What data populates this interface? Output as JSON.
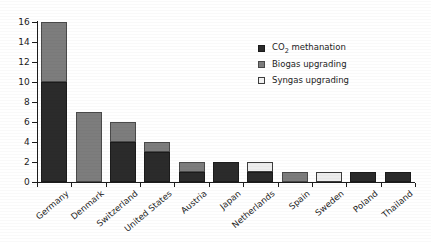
{
  "chart_data": {
    "type": "bar",
    "subtype": "stacked-vertical",
    "title": "",
    "subtitle": "",
    "xlabel": "",
    "ylabel": "",
    "ylim": [
      0,
      16
    ],
    "ytick_step": 2,
    "yticks": [
      "16",
      "14",
      "12",
      "10",
      "8",
      "6",
      "4",
      "2",
      "0"
    ],
    "grid": false,
    "legend_position": "top-right-inside",
    "categories": [
      "Germany",
      "Denmark",
      "Switzerland",
      "United States",
      "Austria",
      "Japan",
      "Netherlands",
      "Spain",
      "Sweden",
      "Poland",
      "Thailand"
    ],
    "series": [
      {
        "name": "CO2 methanation",
        "label_html": "CO<sub>2</sub> methanation",
        "color": "#2b2b2b",
        "values": [
          10,
          0,
          4,
          3,
          1,
          2,
          1,
          0,
          0,
          1,
          1
        ]
      },
      {
        "name": "Biogas upgrading",
        "label_html": "Biogas upgrading",
        "color": "#7d7d7d",
        "values": [
          6,
          7,
          2,
          1,
          1,
          0,
          0,
          1,
          0,
          0,
          0
        ]
      },
      {
        "name": "Syngas upgrading",
        "label_html": "Syngas upgrading",
        "color": "#ededed",
        "values": [
          0,
          0,
          0,
          0,
          0,
          0,
          1,
          0,
          1,
          0,
          0
        ]
      }
    ],
    "totals": [
      16,
      7,
      6,
      4,
      2,
      2,
      2,
      1,
      1,
      1,
      1
    ]
  },
  "legend": {
    "items": [
      {
        "label": "CO",
        "sub": "2",
        "label_tail": " methanation",
        "swatch": "co2"
      },
      {
        "label": "Biogas upgrading",
        "sub": "",
        "label_tail": "",
        "swatch": "biogas"
      },
      {
        "label": "Syngas upgrading",
        "sub": "",
        "label_tail": "",
        "swatch": "syngas"
      }
    ]
  },
  "colors": {
    "co2_methanation": "#2b2b2b",
    "biogas_upgrading": "#7d7d7d",
    "syngas_upgrading": "#ededed",
    "axis": "#1c1c1c",
    "background": "#ffffff"
  }
}
